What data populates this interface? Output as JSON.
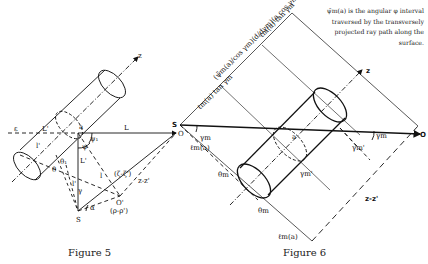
{
  "figure5": {
    "caption": "Figure 5",
    "labels": {
      "z": "z",
      "L": "L",
      "L_prime": "L'",
      "L_prime_vert": "L'",
      "O": "O",
      "S": "S",
      "O_prime": "O'",
      "l": "l",
      "l_prime": "l'",
      "l_prime_s": "l'",
      "psi1": "ψ₁",
      "psi": "ψ",
      "theta1": "θ₁",
      "theta": "θ",
      "gamma": "γ",
      "alpha": "α",
      "epsilon": "ε",
      "a": "a",
      "zeta_diff": "(ζ-ζ')",
      "z_diff": "z-z'",
      "rho_diff": "(ρ-ρ')"
    }
  },
  "figure6": {
    "caption": "Figure 6",
    "note": "ψ̄m(a) is the angular φ interval traversed by the transversely projected ray path along the surface.",
    "labels": {
      "z": "z",
      "O": "O",
      "S": "S",
      "a": "a",
      "gamma_m_s": "γm",
      "gamma_m_o": "γm",
      "gamma_m_prime_1": "γm'",
      "gamma_m_prime_2": "γm'",
      "theta_m_1": "θm",
      "theta_m_2": "θm",
      "l_m_a_1": "ℓm(a)",
      "l_m_a_2": "ℓm(a)",
      "z_diff": "z-z'",
      "dim_top": "ℓm(a) tan γm",
      "dim_mid": "(ψ̄m(a)/cos γm)(d/dγm)(a cos γm)",
      "dim_bottom": "ℓm(a) tan γm"
    }
  }
}
